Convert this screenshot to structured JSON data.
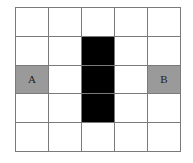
{
  "grid": {
    "rows": 5,
    "cols": 5,
    "colors": {
      "empty": "#ffffff",
      "obstacle": "#000000",
      "marked": "#9a9a9a",
      "line": "#7a7a7a"
    },
    "cells": [
      [
        {
          "type": "empty",
          "label": ""
        },
        {
          "type": "empty",
          "label": ""
        },
        {
          "type": "empty",
          "label": ""
        },
        {
          "type": "empty",
          "label": ""
        },
        {
          "type": "empty",
          "label": ""
        }
      ],
      [
        {
          "type": "empty",
          "label": ""
        },
        {
          "type": "empty",
          "label": ""
        },
        {
          "type": "obstacle",
          "label": ""
        },
        {
          "type": "empty",
          "label": ""
        },
        {
          "type": "empty",
          "label": ""
        }
      ],
      [
        {
          "type": "marked",
          "label": "A"
        },
        {
          "type": "empty",
          "label": ""
        },
        {
          "type": "obstacle",
          "label": ""
        },
        {
          "type": "empty",
          "label": ""
        },
        {
          "type": "marked",
          "label": "B"
        }
      ],
      [
        {
          "type": "empty",
          "label": ""
        },
        {
          "type": "empty",
          "label": ""
        },
        {
          "type": "obstacle",
          "label": ""
        },
        {
          "type": "empty",
          "label": ""
        },
        {
          "type": "empty",
          "label": ""
        }
      ],
      [
        {
          "type": "empty",
          "label": ""
        },
        {
          "type": "empty",
          "label": ""
        },
        {
          "type": "empty",
          "label": ""
        },
        {
          "type": "empty",
          "label": ""
        },
        {
          "type": "empty",
          "label": ""
        }
      ]
    ]
  }
}
